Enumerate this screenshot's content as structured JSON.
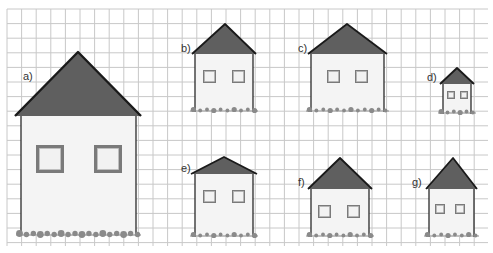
{
  "grid": {
    "x0": 7,
    "y0": 9,
    "x1": 488,
    "y1": 246,
    "step": 14.6,
    "line_color": "#c8c8c8",
    "bg": "#ffffff"
  },
  "colors": {
    "roof": "#5f5f5f",
    "roof_edge": "#1a1a1a",
    "wall": "#f4f4f4",
    "wall_edge": "#2a2a2a",
    "window_frame": "#7a7a7a",
    "window_glass": "#f2f2f2",
    "grass": "#8a8a8a"
  },
  "houses": [
    {
      "label": "a)",
      "apex": [
        78,
        52
      ],
      "roof_base_y": 116,
      "roof_left": 15,
      "roof_right": 141,
      "wall_left": 21,
      "wall_right": 136,
      "bottom": 236,
      "windows": [
        [
          36,
          145,
          28,
          28
        ],
        [
          94,
          145,
          28,
          28
        ]
      ],
      "label_pos": [
        23,
        80
      ]
    },
    {
      "label": "b)",
      "apex": [
        225,
        24
      ],
      "roof_base_y": 54,
      "roof_left": 192,
      "roof_right": 256,
      "wall_left": 195,
      "wall_right": 253,
      "bottom": 112,
      "windows": [
        [
          203,
          70,
          13,
          13
        ],
        [
          232,
          70,
          13,
          13
        ]
      ],
      "label_pos": [
        181,
        52
      ]
    },
    {
      "label": "c)",
      "apex": [
        347,
        24
      ],
      "roof_base_y": 54,
      "roof_left": 308,
      "roof_right": 387,
      "wall_left": 311,
      "wall_right": 384,
      "bottom": 112,
      "windows": [
        [
          327,
          70,
          13,
          13
        ],
        [
          355,
          70,
          13,
          13
        ]
      ],
      "label_pos": [
        298,
        52
      ]
    },
    {
      "label": "d)",
      "apex": [
        457,
        68
      ],
      "roof_base_y": 84,
      "roof_left": 440,
      "roof_right": 474,
      "wall_left": 443,
      "wall_right": 471,
      "bottom": 114,
      "windows": [
        [
          447,
          91,
          8,
          8
        ],
        [
          460,
          91,
          8,
          8
        ]
      ],
      "label_pos": [
        427,
        81
      ]
    },
    {
      "label": "e)",
      "apex": [
        224,
        157
      ],
      "roof_base_y": 174,
      "roof_left": 191,
      "roof_right": 257,
      "wall_left": 195,
      "wall_right": 253,
      "bottom": 237,
      "windows": [
        [
          203,
          190,
          13,
          13
        ],
        [
          232,
          190,
          13,
          13
        ]
      ],
      "label_pos": [
        181,
        172
      ]
    },
    {
      "label": "f)",
      "apex": [
        340,
        158
      ],
      "roof_base_y": 189,
      "roof_left": 308,
      "roof_right": 372,
      "wall_left": 311,
      "wall_right": 369,
      "bottom": 237,
      "windows": [
        [
          318,
          205,
          13,
          13
        ],
        [
          347,
          205,
          13,
          13
        ]
      ],
      "label_pos": [
        298,
        186
      ]
    },
    {
      "label": "g)",
      "apex": [
        453,
        158
      ],
      "roof_base_y": 189,
      "roof_left": 426,
      "roof_right": 477,
      "wall_left": 429,
      "wall_right": 474,
      "bottom": 237,
      "windows": [
        [
          435,
          204,
          10,
          10
        ],
        [
          455,
          204,
          10,
          10
        ]
      ],
      "label_pos": [
        412,
        186
      ]
    }
  ]
}
